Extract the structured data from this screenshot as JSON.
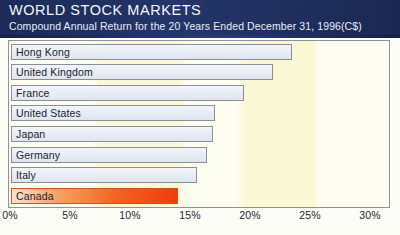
{
  "header": {
    "title": "WORLD STOCK MARKETS",
    "subtitle": "Compound Annual Return for the 20 Years Ended December 31, 1996(C$)",
    "background_color": "#1b2a57",
    "text_color": "#f4f6fb"
  },
  "colors": {
    "header_navy": "#1b2a57",
    "plot_background": "#fbfbe8",
    "bar_fill": "#e7ecf4",
    "bar_border": "#8c8f98",
    "highlight_bar_start": "#fbe2cf",
    "highlight_bar_end": "#ef3c0e",
    "frame_border": "#8f9099",
    "axis_text": "#23262e"
  },
  "footnote": "",
  "chart_data": {
    "type": "bar",
    "orientation": "horizontal",
    "title": "WORLD STOCK MARKETS",
    "subtitle": "Compound Annual Return for the 20 Years Ended December 31, 1996(C$)",
    "xlabel": "",
    "ylabel": "",
    "xlim": [
      0,
      30
    ],
    "grid": false,
    "legend": false,
    "value_unit": "%",
    "tick_labels": [
      "0%",
      "5%",
      "10%",
      "15%",
      "20%",
      "25%",
      "30%"
    ],
    "tick_values": [
      0,
      5,
      10,
      15,
      20,
      25,
      30
    ],
    "categories": [
      "Hong Kong",
      "United Kingdom",
      "France",
      "United States",
      "Japan",
      "Germany",
      "Italy",
      "Canada"
    ],
    "values": [
      23.4,
      21.8,
      19.4,
      17.0,
      16.8,
      16.3,
      15.5,
      13.9
    ],
    "highlight_category": "Canada",
    "bars": [
      {
        "label": "Hong Kong",
        "value": 23.4,
        "highlight": false
      },
      {
        "label": "United Kingdom",
        "value": 21.8,
        "highlight": false
      },
      {
        "label": "France",
        "value": 19.4,
        "highlight": false
      },
      {
        "label": "United States",
        "value": 17.0,
        "highlight": false
      },
      {
        "label": "Japan",
        "value": 16.8,
        "highlight": false
      },
      {
        "label": "Germany",
        "value": 16.3,
        "highlight": false
      },
      {
        "label": "Italy",
        "value": 15.5,
        "highlight": false
      },
      {
        "label": "Canada",
        "value": 13.9,
        "highlight": true
      }
    ]
  }
}
